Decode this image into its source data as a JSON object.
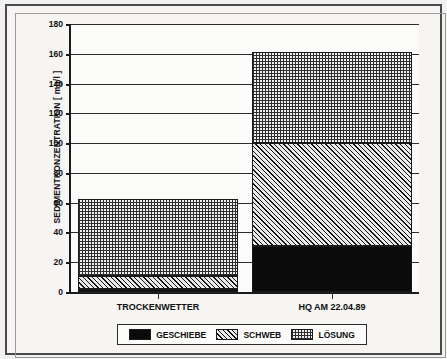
{
  "chart_data": {
    "type": "bar",
    "subtype": "stacked-bar",
    "title": "",
    "xlabel": "",
    "ylabel": "SEDIMENTKONZENTRATION  [ mg/l ]",
    "ylim": [
      0,
      180
    ],
    "ytick_step": 20,
    "ytick_labels": [
      "0",
      "20",
      "40",
      "60",
      "80",
      "100",
      "120",
      "140",
      "160",
      "180"
    ],
    "ytick_values": [
      0,
      20,
      40,
      60,
      80,
      100,
      120,
      140,
      160,
      180
    ],
    "grid": true,
    "grid_axis": "y",
    "legend_position": "bottom",
    "categories": [
      "TROCKENWETTER",
      "HQ AM 22.04.89"
    ],
    "series": [
      {
        "name": "GESCHIEBE",
        "pattern": "solid-black",
        "color": "#0b0b0b",
        "values": [
          2,
          31
        ]
      },
      {
        "name": "SCHWEB",
        "pattern": "diagonal-hatch",
        "color": "#e9e9e9",
        "values": [
          9,
          69
        ]
      },
      {
        "name": "LÖSUNG",
        "pattern": "dotted-stipple",
        "color": "#f0efee",
        "values": [
          51.5,
          61
        ]
      }
    ],
    "totals": [
      62.5,
      161
    ],
    "annotations": []
  },
  "legend": {
    "items": [
      {
        "label": "GESCHIEBE",
        "pattern": "solid-black"
      },
      {
        "label": "SCHWEB",
        "pattern": "diagonal-hatch"
      },
      {
        "label": "LÖSUNG",
        "pattern": "dotted-stipple"
      }
    ]
  },
  "axis": {
    "y_title": "SEDIMENTKONZENTRATION  [ mg/l ]"
  },
  "colors": {
    "frame": "#4a4a4a",
    "page_background": "#f2f1ef",
    "plot_background": "#fbfbfa",
    "axis": "#1a1a1a",
    "grid": "#2b2b2b"
  }
}
